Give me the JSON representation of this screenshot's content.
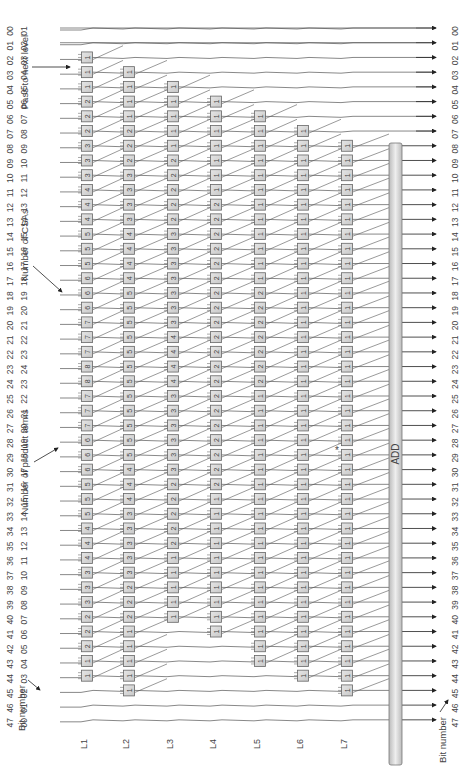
{
  "annotations": {
    "pass_to_next_level": "Pass to next level",
    "number_of_csas": "Number of CSAs",
    "number_of_product_terms": "Number of product terms",
    "bit_number_top": "Bit number",
    "bit_number_bottom": "Bit number",
    "asterisk": "*"
  },
  "adder_label": "ADD",
  "levels": [
    "L1",
    "L2",
    "L3",
    "L4",
    "L5",
    "L6",
    "L7"
  ],
  "bit_numbers_desc": [
    "47",
    "46",
    "45",
    "44",
    "43",
    "42",
    "41",
    "40",
    "39",
    "38",
    "37",
    "36",
    "35",
    "34",
    "33",
    "32",
    "31",
    "30",
    "29",
    "28",
    "27",
    "26",
    "25",
    "24",
    "23",
    "22",
    "21",
    "20",
    "19",
    "18",
    "17",
    "16",
    "15",
    "14",
    "13",
    "12",
    "11",
    "10",
    "09",
    "08",
    "07",
    "06",
    "05",
    "04",
    "03",
    "02",
    "01",
    "00"
  ],
  "product_terms": [
    "01",
    "02",
    "03",
    "04",
    "05",
    "06",
    "07",
    "08",
    "09",
    "10",
    "11",
    "12",
    "13",
    "14",
    "15",
    "16",
    "17",
    "18",
    "19",
    "20",
    "21",
    "22",
    "23",
    "24",
    "23",
    "22",
    "21",
    "20",
    "19",
    "18",
    "17",
    "16",
    "15",
    "14",
    "13",
    "12",
    "11",
    "10",
    "09",
    "08",
    "07",
    "06",
    "05",
    "04",
    "03",
    "02",
    "01",
    "00"
  ],
  "output_bits": [
    "00",
    "01",
    "02",
    "03",
    "04",
    "05",
    "06",
    "07",
    "08",
    "09",
    "10",
    "11",
    "12",
    "13",
    "14",
    "15",
    "16",
    "17",
    "18",
    "19",
    "20",
    "21",
    "22",
    "23",
    "24",
    "25",
    "26",
    "27",
    "28",
    "29",
    "30",
    "31",
    "32",
    "33",
    "34",
    "35",
    "36",
    "37",
    "38",
    "39",
    "40",
    "41",
    "42",
    "43",
    "44",
    "45",
    "46",
    "47"
  ],
  "csa_counts": {
    "L1": [
      0,
      0,
      1,
      1,
      1,
      2,
      2,
      2,
      3,
      3,
      3,
      4,
      4,
      4,
      5,
      5,
      5,
      6,
      6,
      6,
      7,
      7,
      7,
      8,
      8,
      7,
      7,
      7,
      6,
      6,
      6,
      5,
      5,
      5,
      4,
      4,
      4,
      3,
      3,
      3,
      2,
      2,
      2,
      1,
      1,
      0,
      0,
      0
    ],
    "L2": [
      0,
      0,
      0,
      1,
      1,
      1,
      1,
      2,
      2,
      2,
      3,
      3,
      3,
      3,
      4,
      4,
      4,
      4,
      5,
      5,
      5,
      5,
      5,
      5,
      5,
      5,
      5,
      5,
      5,
      5,
      4,
      4,
      4,
      3,
      3,
      3,
      3,
      3,
      2,
      2,
      2,
      1,
      1,
      1,
      1,
      1,
      0,
      0
    ],
    "L3": [
      0,
      0,
      0,
      0,
      1,
      1,
      1,
      1,
      1,
      2,
      2,
      2,
      2,
      2,
      3,
      3,
      3,
      3,
      3,
      3,
      3,
      4,
      4,
      4,
      4,
      3,
      3,
      3,
      3,
      3,
      3,
      2,
      2,
      2,
      2,
      2,
      1,
      1,
      1,
      1,
      1,
      0,
      0,
      0,
      0,
      0,
      0,
      0
    ],
    "L4": [
      0,
      0,
      0,
      0,
      0,
      1,
      1,
      1,
      1,
      1,
      1,
      1,
      2,
      2,
      2,
      2,
      2,
      2,
      2,
      2,
      2,
      2,
      2,
      2,
      2,
      2,
      2,
      2,
      2,
      2,
      2,
      2,
      1,
      1,
      1,
      1,
      1,
      1,
      1,
      1,
      1,
      1,
      0,
      0,
      0,
      0,
      0,
      0
    ],
    "L5": [
      0,
      0,
      0,
      0,
      0,
      0,
      1,
      1,
      1,
      1,
      1,
      1,
      1,
      1,
      1,
      1,
      1,
      1,
      2,
      2,
      2,
      2,
      2,
      2,
      2,
      1,
      1,
      1,
      1,
      1,
      1,
      1,
      1,
      1,
      1,
      1,
      1,
      1,
      1,
      1,
      1,
      1,
      1,
      1,
      0,
      0,
      0,
      0
    ],
    "L6": [
      0,
      0,
      0,
      0,
      0,
      0,
      0,
      1,
      1,
      1,
      1,
      1,
      1,
      1,
      1,
      1,
      1,
      1,
      1,
      1,
      1,
      1,
      1,
      1,
      1,
      1,
      1,
      1,
      1,
      1,
      1,
      1,
      1,
      1,
      1,
      1,
      1,
      1,
      1,
      1,
      1,
      1,
      1,
      1,
      1,
      0,
      0,
      0
    ],
    "L7": [
      0,
      0,
      0,
      0,
      0,
      0,
      0,
      0,
      1,
      1,
      1,
      1,
      1,
      1,
      1,
      1,
      1,
      1,
      1,
      1,
      1,
      1,
      1,
      1,
      1,
      1,
      1,
      1,
      1,
      1,
      1,
      1,
      1,
      1,
      1,
      1,
      1,
      1,
      1,
      1,
      1,
      1,
      1,
      1,
      1,
      1,
      0,
      0
    ]
  }
}
